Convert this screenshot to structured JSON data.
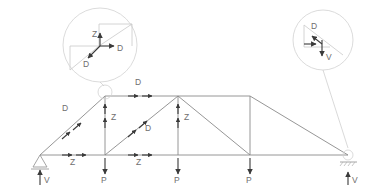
{
  "diagram": {
    "type": "truss-free-body-diagram",
    "title": "",
    "stroke_color": "#8a8a8a",
    "arrow_color": "#3a3a3a",
    "label_color": "#6e6e6e",
    "detail_color": "#d2d2d2"
  },
  "labels": {
    "diagonal_left": "D",
    "top_chord": "D",
    "vertical_left": "Z",
    "diagonal_mid": "D",
    "vertical_mid": "Z",
    "bottom_left": "Z",
    "bottom_mid": "Z",
    "load_1": "P",
    "load_2": "P",
    "load_3": "P",
    "reaction_left": "V",
    "reaction_right": "V"
  },
  "detail_left": {
    "name": "joint-detail-upper-left",
    "force_up": "Z",
    "force_right": "D",
    "force_lower_left": "D"
  },
  "detail_right": {
    "name": "support-detail-upper-right",
    "force_diagonal": "D",
    "force_down": "V"
  },
  "supports": {
    "left": "pin-support",
    "right": "roller-support"
  },
  "geometry": {
    "bottom_chord_y": 155,
    "top_chord_y": 96,
    "left_support_x": 40,
    "right_support_x": 348,
    "panel_nodes_x": [
      105,
      178,
      250
    ]
  }
}
